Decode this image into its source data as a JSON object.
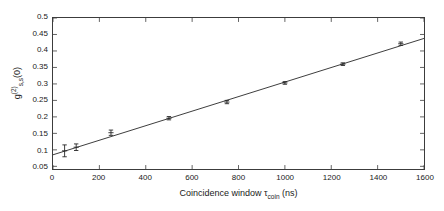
{
  "chart_data": {
    "type": "scatter",
    "title": "",
    "xlabel": "Coincidence window τ_coin (ns)",
    "xlabel_parts": {
      "text": "Coincidence window",
      "symbol": "τ",
      "subscript": "coin",
      "unit": "(ns)"
    },
    "ylabel": "g(2)_s,s(0)",
    "ylabel_parts": {
      "base": "g",
      "superscript": "(2)",
      "subscript": "s,s",
      "arg": "(0)"
    },
    "xlim": [
      0,
      1600
    ],
    "ylim": [
      0.0419,
      0.5
    ],
    "xticks": [
      0,
      200,
      400,
      600,
      800,
      1000,
      1200,
      1400,
      1600
    ],
    "xtick_labels": [
      "0",
      "200",
      "400",
      "600",
      "800",
      "1000",
      "1200",
      "1400",
      "1600"
    ],
    "yticks": [
      0.05,
      0.1,
      0.15,
      0.2,
      0.25,
      0.3,
      0.35,
      0.4,
      0.45,
      0.5
    ],
    "ytick_labels": [
      "0.05",
      "0.1",
      "0.15",
      "0.2",
      "0.25",
      "0.3",
      "0.35",
      "0.4",
      "0.45",
      "0.5"
    ],
    "grid": false,
    "legend": false,
    "legend_position": "none",
    "marker_color": "#262626",
    "line_color": "#262626",
    "frame_color": "#3c3c3c",
    "x": [
      50,
      100,
      250,
      500,
      750,
      1000,
      1250,
      1500
    ],
    "values": [
      0.097,
      0.108,
      0.152,
      0.196,
      0.245,
      0.303,
      0.36,
      0.422
    ],
    "yerr": [
      0.018,
      0.01,
      0.008,
      0.005,
      0.005,
      0.004,
      0.004,
      0.005
    ],
    "series": [
      {
        "name": "measured g2",
        "type": "scatter",
        "x": [
          50,
          100,
          250,
          500,
          750,
          1000,
          1250,
          1500
        ],
        "values": [
          0.097,
          0.108,
          0.152,
          0.196,
          0.245,
          0.303,
          0.36,
          0.422
        ],
        "yerr": [
          0.018,
          0.01,
          0.008,
          0.005,
          0.005,
          0.004,
          0.004,
          0.005
        ]
      },
      {
        "name": "linear fit",
        "type": "line",
        "x": [
          0,
          1600
        ],
        "values": [
          0.085,
          0.438
        ],
        "slope_per_ns": 0.00022063,
        "intercept": 0.085
      }
    ]
  }
}
